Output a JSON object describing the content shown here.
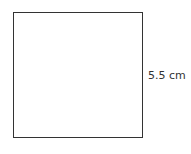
{
  "diagram": {
    "shape": "square",
    "side_label": "5.5 cm",
    "stroke_color": "#333333",
    "background": "#ffffff"
  }
}
